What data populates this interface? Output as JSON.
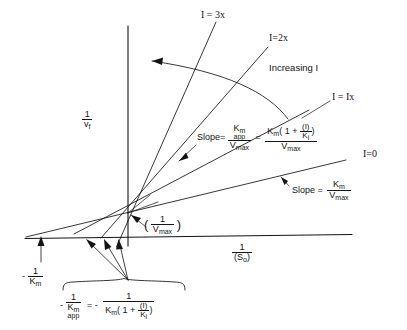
{
  "figure": {
    "type": "lineweaver-burk-plot",
    "axes": {
      "y_label_num": "1",
      "y_label_den": "v",
      "y_label_den_sub": "f",
      "x_label_num": "1",
      "x_label_den": "(S",
      "x_label_den_sub": "o",
      "x_label_den_close": ")"
    },
    "lines": [
      {
        "name": "I=3x",
        "label": "I = 3x"
      },
      {
        "name": "I=2x",
        "label": "I=2x"
      },
      {
        "name": "I=1x",
        "label": "I = Ix"
      },
      {
        "name": "I=0",
        "label": "I=0"
      }
    ],
    "annotations": {
      "increasing": "Increasing I",
      "slope_word": "Slope=",
      "slope_word_spaced": "Slope =",
      "equals": "=",
      "minus": "-",
      "minus_eq_minus": "= -"
    },
    "slope_app": {
      "num_K": "K",
      "num_K_sub": "m",
      "num_K_sub2": "app",
      "den": "V",
      "den_sub": "max"
    },
    "slope_app_expanded": {
      "num_K": "K",
      "num_K_sub": "m",
      "num_open": "( 1 +",
      "inner_num": "(I)",
      "inner_den": "K",
      "inner_den_sub": "i",
      "num_close": ")",
      "den": "V",
      "den_sub": "max"
    },
    "slope_zero": {
      "num": "K",
      "num_sub": "m",
      "den": "V",
      "den_sub": "max"
    },
    "y_intercept": {
      "open": "(",
      "num": "1",
      "den": "V",
      "den_sub": "max",
      "close": ")"
    },
    "x_intercept_km": {
      "minus": "-",
      "num": "1",
      "den": "K",
      "den_sub": "m"
    },
    "x_intercept_app": {
      "minus": "-",
      "num": "1",
      "den": "K",
      "den_sub": "m",
      "den_sub2": "app"
    },
    "x_intercept_expanded": {
      "num": "1",
      "den_K": "K",
      "den_K_sub": "m",
      "den_open": "( 1 +",
      "inner_num": "(I)",
      "inner_den": "K",
      "inner_den_sub": "i",
      "den_close": ")"
    },
    "colors": {
      "ink": "#141414",
      "background": "#ffffff"
    }
  }
}
